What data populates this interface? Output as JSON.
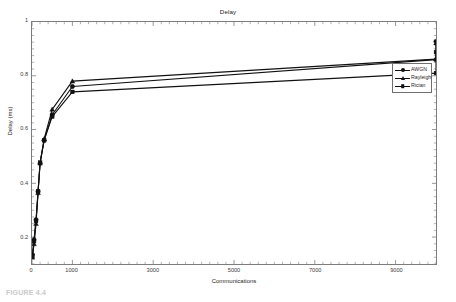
{
  "figure": {
    "background_color": "#ffffff",
    "axis_color": "#7d7d7d",
    "series_color": "#111111"
  },
  "caption": {
    "text": "FIGURE 4.4"
  },
  "chart_data": {
    "type": "line",
    "title": "Delay",
    "xlabel": "Communications",
    "ylabel": "Delay (ms)",
    "xlim": [
      0,
      10000
    ],
    "ylim": [
      0.1,
      1
    ],
    "grid": false,
    "legend_position": "upper-right-inside",
    "xticks": [
      0,
      1000,
      3000,
      5000,
      7000,
      9000
    ],
    "xtick_labels": [
      "0",
      "1000",
      "3000",
      "5000",
      "7000",
      "9000"
    ],
    "xticks_minor_step": 200,
    "yticks": [
      0.2,
      0.4,
      0.6,
      0.8,
      1
    ],
    "ytick_labels": [
      "0.2",
      "0.4",
      "0.6",
      "0.8",
      "1"
    ],
    "yticks_minor_step": 0.025,
    "x": [
      10,
      50,
      100,
      150,
      200,
      300,
      500,
      1000,
      10000
    ],
    "series": [
      {
        "name": "AWGN",
        "marker": "circle",
        "values": [
          0.135,
          0.19,
          0.265,
          0.37,
          0.475,
          0.56,
          0.655,
          0.76,
          0.86
        ]
      },
      {
        "name": "Rayleigh",
        "marker": "triangle",
        "values": [
          0.125,
          0.175,
          0.25,
          0.365,
          0.475,
          0.565,
          0.675,
          0.78,
          0.862
        ]
      },
      {
        "name": "Rician",
        "marker": "square",
        "values": [
          0.13,
          0.185,
          0.26,
          0.37,
          0.477,
          0.56,
          0.648,
          0.74,
          0.81
        ]
      }
    ],
    "series_endpoints": [
      {
        "name": "AWGN",
        "x": 10000,
        "y": 0.928
      },
      {
        "name": "Rayleigh",
        "x": 10000,
        "y": 0.922
      },
      {
        "name": "Rician",
        "x": 10000,
        "y": 0.888
      }
    ]
  }
}
